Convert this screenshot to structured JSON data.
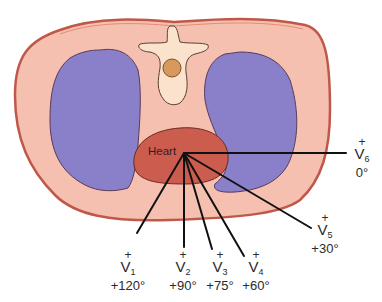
{
  "diagram": {
    "type": "cross-section chest with precordial ECG leads",
    "colors": {
      "body_fill": "#f6c0b0",
      "body_outline": "#c0584a",
      "lung_fill": "#8a7fc9",
      "lung_outline": "#5a3a5a",
      "spine_fill": "#fbe2cc",
      "spinal_cord": "#d89a5c",
      "heart_fill": "#cc5c4e",
      "lead_lines": "#111111"
    },
    "heart_label": "Heart",
    "leads": [
      {
        "name": "V",
        "sub": "1",
        "polarity": "+",
        "angle": "+120°"
      },
      {
        "name": "V",
        "sub": "2",
        "polarity": "+",
        "angle": "+90°"
      },
      {
        "name": "V",
        "sub": "3",
        "polarity": "+",
        "angle": "+75°"
      },
      {
        "name": "V",
        "sub": "4",
        "polarity": "+",
        "angle": "+60°"
      },
      {
        "name": "V",
        "sub": "5",
        "polarity": "+",
        "angle": "+30°"
      },
      {
        "name": "V",
        "sub": "6",
        "polarity": "+",
        "angle": "0°"
      }
    ]
  }
}
